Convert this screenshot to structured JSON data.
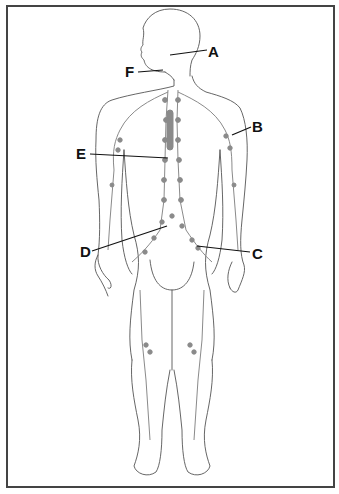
{
  "diagram": {
    "labels": [
      {
        "id": "A",
        "text": "A",
        "x": 208,
        "y": 44,
        "points_to": "lymph vessels/nodes at back of head/neck",
        "line": [
          [
            170,
            55
          ],
          [
            207,
            50
          ]
        ]
      },
      {
        "id": "B",
        "text": "B",
        "x": 252,
        "y": 119,
        "points_to": "axillary lymph nodes (left armpit)",
        "line": [
          [
            232,
            135
          ],
          [
            251,
            127
          ]
        ]
      },
      {
        "id": "C",
        "text": "C",
        "x": 252,
        "y": 246,
        "points_to": "inguinal lymph nodes (groin)",
        "line": [
          [
            197,
            246
          ],
          [
            250,
            252
          ]
        ]
      },
      {
        "id": "D",
        "text": "D",
        "x": 80,
        "y": 244,
        "points_to": "cisterna chyli / abdominal lymph nodes",
        "line": [
          [
            92,
            251
          ],
          [
            167,
            226
          ]
        ]
      },
      {
        "id": "E",
        "text": "E",
        "x": 76,
        "y": 146,
        "points_to": "thoracic duct",
        "line": [
          [
            90,
            154
          ],
          [
            168,
            158
          ]
        ]
      },
      {
        "id": "F",
        "text": "F",
        "x": 125,
        "y": 64,
        "points_to": "cervical/submandibular lymph nodes",
        "line": [
          [
            138,
            72
          ],
          [
            163,
            70
          ]
        ]
      }
    ],
    "colors": {
      "frame": "#444444",
      "outline": "#555555",
      "lymph": "#8a8a8a",
      "label": "#111111"
    }
  }
}
